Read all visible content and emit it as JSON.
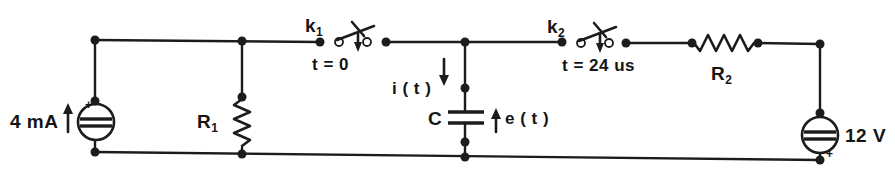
{
  "diagram": {
    "type": "electrical-schematic",
    "colors": {
      "ink": "#1c1c1c",
      "background": "#ffffff"
    }
  },
  "labels": {
    "current_source": "4 mA",
    "current_source_polarity": "+",
    "resistor1_name": "R",
    "resistor1_sub": "1",
    "switch1_name": "k",
    "switch1_sub": "1",
    "switch1_time": "t = 0",
    "current_arrow": "i ( t )",
    "capacitor_name": "C",
    "capacitor_voltage": "e ( t )",
    "switch2_name": "k",
    "switch2_sub": "2",
    "switch2_time": "t = 24 us",
    "resistor2_name": "R",
    "resistor2_sub": "2",
    "voltage_source": "12 V",
    "voltage_source_polarity": "+"
  }
}
